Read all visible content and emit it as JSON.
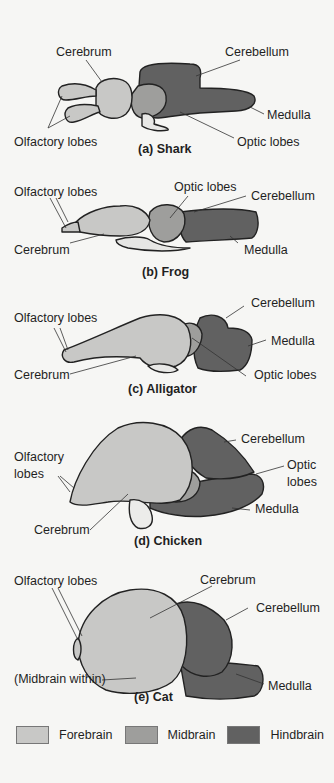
{
  "colors": {
    "forebrain": "#c8c8c6",
    "midbrain": "#9e9e9c",
    "hindbrain": "#616161",
    "outline": "#222222",
    "background": "#f6f6f4"
  },
  "panels": [
    {
      "id": "shark",
      "caption": "(a)  Shark",
      "labels": {
        "cerebrum": "Cerebrum",
        "cerebellum": "Cerebellum",
        "medulla": "Medulla",
        "olfactory": "Olfactory lobes",
        "optic": "Optic lobes"
      }
    },
    {
      "id": "frog",
      "caption": "(b)  Frog",
      "labels": {
        "olfactory": "Olfactory lobes",
        "optic": "Optic lobes",
        "cerebellum": "Cerebellum",
        "cerebrum": "Cerebrum",
        "medulla": "Medulla"
      }
    },
    {
      "id": "alligator",
      "caption": "(c) Alligator",
      "labels": {
        "cerebellum": "Cerebellum",
        "olfactory": "Olfactory lobes",
        "medulla": "Medulla",
        "cerebrum": "Cerebrum",
        "optic": "Optic lobes"
      }
    },
    {
      "id": "chicken",
      "caption": "(d)  Chicken",
      "labels": {
        "cerebellum": "Cerebellum",
        "olfactory_1": "Olfactory",
        "olfactory_2": "lobes",
        "optic_1": "Optic",
        "optic_2": "lobes",
        "medulla": "Medulla",
        "cerebrum": "Cerebrum"
      }
    },
    {
      "id": "cat",
      "caption": "(e)  Cat",
      "labels": {
        "olfactory": "Olfactory lobes",
        "cerebrum": "Cerebrum",
        "cerebellum": "Cerebellum",
        "midbrain": "(Midbrain within)",
        "medulla": "Medulla"
      }
    }
  ],
  "legend": [
    {
      "label": "Forebrain",
      "color": "#c8c8c6"
    },
    {
      "label": "Midbrain",
      "color": "#9e9e9c"
    },
    {
      "label": "Hindbrain",
      "color": "#616161"
    }
  ]
}
